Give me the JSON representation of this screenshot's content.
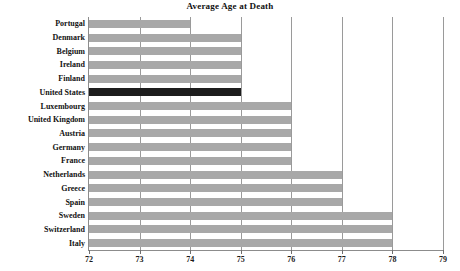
{
  "chart_data": {
    "type": "bar",
    "orientation": "horizontal",
    "title": "Average Age at Death",
    "xlabel": "",
    "ylabel": "",
    "xlim": [
      72,
      79
    ],
    "ylim": null,
    "grid": true,
    "legend": null,
    "xticks": [
      "72",
      "73",
      "74",
      "75",
      "76",
      "77",
      "78",
      "79"
    ],
    "categories": [
      "Portugal",
      "Denmark",
      "Belgium",
      "Ireland",
      "Finland",
      "United States",
      "Luxembourg",
      "United Kingdom",
      "Austria",
      "Germany",
      "France",
      "Netherlands",
      "Greece",
      "Spain",
      "Sweden",
      "Switzerland",
      "Italy"
    ],
    "values": [
      74,
      75,
      75,
      75,
      75,
      75,
      76,
      76,
      76,
      76,
      76,
      77,
      77,
      77,
      78,
      78,
      78
    ],
    "highlighted": [
      "United States"
    ],
    "colors": {
      "bar": "#a8a8a8",
      "bar_highlight": "#1d1d1d",
      "gridline": "#9a9a9a",
      "axis": "#8c8c8c",
      "text": "#121212",
      "background": "#ffffff"
    }
  }
}
